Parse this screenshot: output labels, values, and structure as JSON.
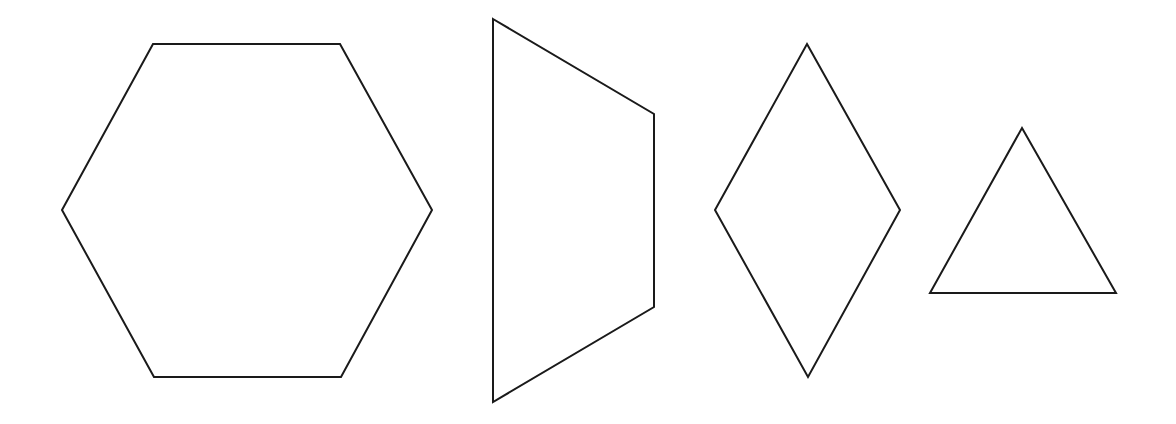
{
  "canvas": {
    "width": 1176,
    "height": 424,
    "background": "#ffffff"
  },
  "style": {
    "stroke": "#1a1a1a",
    "stroke_width": 2,
    "fill": "none"
  },
  "shapes": [
    {
      "id": "hexagon",
      "kind": "regular hexagon",
      "points": [
        [
          153,
          44
        ],
        [
          340,
          44
        ],
        [
          432,
          210
        ],
        [
          341,
          377
        ],
        [
          154,
          377
        ],
        [
          62,
          210
        ]
      ]
    },
    {
      "id": "trapezoid",
      "kind": "trapezoid",
      "points": [
        [
          493,
          19
        ],
        [
          654,
          114
        ],
        [
          654,
          307
        ],
        [
          493,
          402
        ]
      ]
    },
    {
      "id": "rhombus",
      "kind": "rhombus",
      "points": [
        [
          807,
          44
        ],
        [
          900,
          210
        ],
        [
          808,
          377
        ],
        [
          715,
          210
        ]
      ]
    },
    {
      "id": "triangle",
      "kind": "equilateral triangle",
      "points": [
        [
          1022,
          128
        ],
        [
          1116,
          293
        ],
        [
          930,
          293
        ]
      ]
    }
  ]
}
